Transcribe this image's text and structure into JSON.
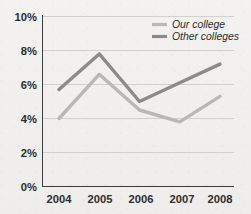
{
  "chart_data": {
    "type": "line",
    "title": "",
    "subtitle": "",
    "xlabel": "",
    "ylabel": "",
    "categories": [
      "2004",
      "2005",
      "2006",
      "2007",
      "2008"
    ],
    "series": [
      {
        "name": "Our college",
        "values": [
          4.0,
          6.6,
          4.5,
          3.8,
          5.3
        ],
        "color": "#b9b8b6"
      },
      {
        "name": "Other colleges",
        "values": [
          5.7,
          7.8,
          5.0,
          6.1,
          7.2
        ],
        "color": "#8c8b89"
      }
    ],
    "ylim": [
      0,
      10
    ],
    "yticks": [
      0,
      2,
      4,
      6,
      8,
      10
    ],
    "ytick_labels": [
      "0%",
      "2%",
      "4%",
      "6%",
      "8%",
      "10%"
    ],
    "xtick_labels": [
      "2004",
      "2005",
      "2006",
      "2007",
      "2008"
    ],
    "grid": "horizontal",
    "legend_position": "top-right",
    "value_suffix": "%"
  },
  "legend": {
    "items": [
      {
        "label": "Our college"
      },
      {
        "label": "Other colleges"
      }
    ]
  },
  "axes": {
    "y_tick_labels": [
      "10%",
      "8%",
      "6%",
      "4%",
      "2%",
      "0%"
    ],
    "x_tick_labels": [
      "2004",
      "2005",
      "2006",
      "2007",
      "2008"
    ]
  },
  "colors": {
    "background": "#f2f1ef",
    "grid": "#d2d0cd",
    "axis": "#3d3d3d",
    "series_light": "#b9b8b6",
    "series_dark": "#8c8b89",
    "text": "#2e2e2e"
  }
}
